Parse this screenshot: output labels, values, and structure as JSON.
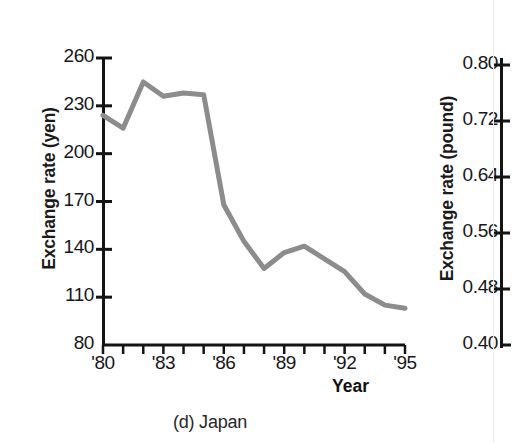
{
  "figure": {
    "caption": "(d) Japan",
    "xaxis_title": "Year"
  },
  "chart_data": {
    "type": "line",
    "title": "(d) Japan",
    "xlabel": "Year",
    "ylabel": "Exchange rate (yen)",
    "xlim": [
      1980,
      1995
    ],
    "ylim": [
      80,
      260
    ],
    "grid": false,
    "legend": "none",
    "line_color": "#8c8c8c",
    "x": [
      1980,
      1981,
      1982,
      1983,
      1984,
      1985,
      1986,
      1987,
      1988,
      1989,
      1990,
      1991,
      1992,
      1993,
      1994,
      1995
    ],
    "values": [
      224,
      216,
      245,
      236,
      238,
      237,
      168,
      145,
      128,
      138,
      142,
      134,
      126,
      112,
      105,
      103
    ],
    "ytick_labels": [
      "260",
      "230",
      "200",
      "170",
      "140",
      "110",
      "80"
    ],
    "ytick_values": [
      260,
      230,
      200,
      170,
      140,
      110,
      80
    ],
    "xtick_labels": [
      "'80",
      "'83",
      "'86",
      "'89",
      "'92",
      "'95"
    ],
    "xtick_values": [
      1980,
      1983,
      1986,
      1989,
      1992,
      1995
    ],
    "minor_xticks": 16
  },
  "secondary_chart": {
    "type": "line",
    "ylabel": "Exchange rate (pound)",
    "ylim": [
      0.4,
      0.8
    ],
    "ytick_labels": [
      "0.80",
      "0.72",
      "0.64",
      "0.56",
      "0.48",
      "0.40"
    ],
    "ytick_values": [
      0.8,
      0.72,
      0.64,
      0.56,
      0.48,
      0.4
    ],
    "note": "partially visible panel at right edge"
  }
}
